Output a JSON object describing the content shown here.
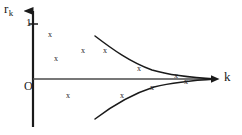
{
  "figure": {
    "width": 242,
    "height": 135,
    "background": "#ffffff",
    "ink_color": "#1a1a1a",
    "point_color": "#262626",
    "point_glyph": "x"
  },
  "axes": {
    "origin_label": "O",
    "y_axis": {
      "label_main": "r",
      "label_sub": "k",
      "label_full": "r_k",
      "ticks": [
        {
          "value": "1",
          "label": "1",
          "y_px": 24
        }
      ],
      "arrow": "up",
      "x_px": 33,
      "top_px": 5,
      "bottom_px": 127
    },
    "x_axis": {
      "label": "k",
      "ticks": [],
      "arrow": "right",
      "y_px": 79,
      "left_px": 33,
      "right_px": 219
    }
  },
  "chart_data": {
    "type": "scatter",
    "title": "",
    "xlabel": "k",
    "ylabel": "r_k",
    "grid": false,
    "legend": null,
    "xlim": [
      0,
      10
    ],
    "ylim": [
      -0.6,
      1.05
    ],
    "series": [
      {
        "name": "sample autocorrelations",
        "type": "scatter",
        "marker": "x",
        "points": [
          {
            "x": 0.82,
            "y": 0.73,
            "px": 50,
            "py": 35
          },
          {
            "x": 1.25,
            "y": 0.41,
            "px": 56,
            "py": 59
          },
          {
            "x": 2.7,
            "y": 0.52,
            "px": 83,
            "py": 51
          },
          {
            "x": 3.9,
            "y": 0.36,
            "px": 105,
            "py": 51
          },
          {
            "x": 5.75,
            "y": 0.13,
            "px": 139,
            "py": 69
          },
          {
            "x": 7.7,
            "y": 0.04,
            "px": 176,
            "py": 76
          },
          {
            "x": 8.3,
            "y": -0.02,
            "px": 186,
            "py": 82
          },
          {
            "x": 1.9,
            "y": -0.18,
            "px": 68,
            "py": 96
          },
          {
            "x": 4.7,
            "y": -0.21,
            "px": 122,
            "py": 96
          },
          {
            "x": 6.4,
            "y": -0.11,
            "px": 152,
            "py": 88
          }
        ]
      },
      {
        "name": "upper envelope",
        "type": "line",
        "path_px": "M 95,36 C 112,49 130,62 152,70 C 172,76 198,78 216,79"
      },
      {
        "name": "lower envelope",
        "type": "line",
        "path_px": "M 95,119 C 112,106 132,94 154,87 C 174,82 199,80 216,79"
      }
    ]
  }
}
